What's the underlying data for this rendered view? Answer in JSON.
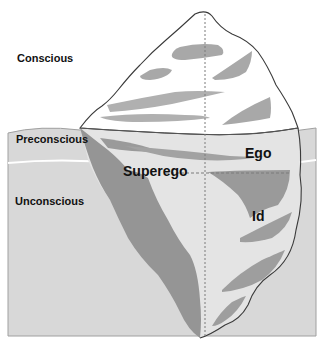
{
  "diagram": {
    "type": "iceberg-model-of-mind",
    "levels": [
      {
        "label": "Conscious"
      },
      {
        "label": "Preconscious"
      },
      {
        "label": "Unconscious"
      }
    ],
    "structures": [
      {
        "label": "Ego"
      },
      {
        "label": "Superego"
      },
      {
        "label": "Id"
      }
    ],
    "colors": {
      "water": "#d9d9d9",
      "water_outline": "#9a9a9a",
      "iceberg_above": "#ffffff",
      "iceberg_below": "#e4e4e4",
      "shading": "#a6a6a6",
      "dark_shading": "#8e8e8e",
      "outline": "#3a3a3a",
      "waterline": "#ffffff",
      "dashed_line": "#7a7a7a"
    }
  }
}
